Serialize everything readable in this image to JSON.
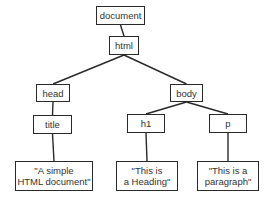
{
  "diagram": {
    "type": "tree",
    "nodes": [
      {
        "id": "document",
        "label": "document"
      },
      {
        "id": "html",
        "label": "html"
      },
      {
        "id": "head",
        "label": "head"
      },
      {
        "id": "body",
        "label": "body"
      },
      {
        "id": "title",
        "label": "title"
      },
      {
        "id": "h1",
        "label": "h1"
      },
      {
        "id": "p",
        "label": "p"
      },
      {
        "id": "text_title",
        "label": "\"A simple\nHTML document\""
      },
      {
        "id": "text_h1",
        "label": "\"This is\na Heading\""
      },
      {
        "id": "text_p",
        "label": "\"This is a\nparagraph\""
      }
    ],
    "edges": [
      {
        "from": "document",
        "to": "html"
      },
      {
        "from": "html",
        "to": "head"
      },
      {
        "from": "html",
        "to": "body"
      },
      {
        "from": "head",
        "to": "title"
      },
      {
        "from": "body",
        "to": "h1"
      },
      {
        "from": "body",
        "to": "p"
      },
      {
        "from": "title",
        "to": "text_title"
      },
      {
        "from": "h1",
        "to": "text_h1"
      },
      {
        "from": "p",
        "to": "text_p"
      }
    ]
  }
}
